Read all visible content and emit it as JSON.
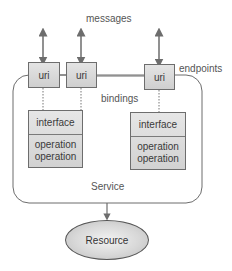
{
  "diagram": {
    "labels": {
      "messages": "messages",
      "endpoints": "endpoints",
      "bindings": "bindings",
      "service": "Service"
    },
    "endpoints": [
      {
        "label": "uri"
      },
      {
        "label": "uri"
      },
      {
        "label": "uri"
      }
    ],
    "interfaces": [
      {
        "title": "interface",
        "operations": [
          "operation",
          "operation"
        ]
      },
      {
        "title": "interface",
        "operations": [
          "operation",
          "operation"
        ]
      }
    ],
    "resource": {
      "label": "Resource"
    },
    "colors": {
      "stroke": "#6d6d6d",
      "box_fill_top": "#e4e4e4",
      "box_fill_bottom": "#cfcfcf",
      "text": "#3a3a3a"
    }
  }
}
